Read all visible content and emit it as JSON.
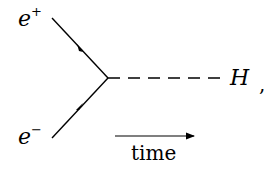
{
  "diagram": {
    "type": "feynman",
    "particles": {
      "incoming_top": {
        "symbol": "e",
        "charge": "+"
      },
      "incoming_bottom": {
        "symbol": "e",
        "charge": "−"
      },
      "outgoing": {
        "symbol": "H"
      }
    },
    "trailing_punctuation": ",",
    "time_axis_label": "time",
    "colors": {
      "line": "#000000",
      "background": "#ffffff"
    }
  }
}
